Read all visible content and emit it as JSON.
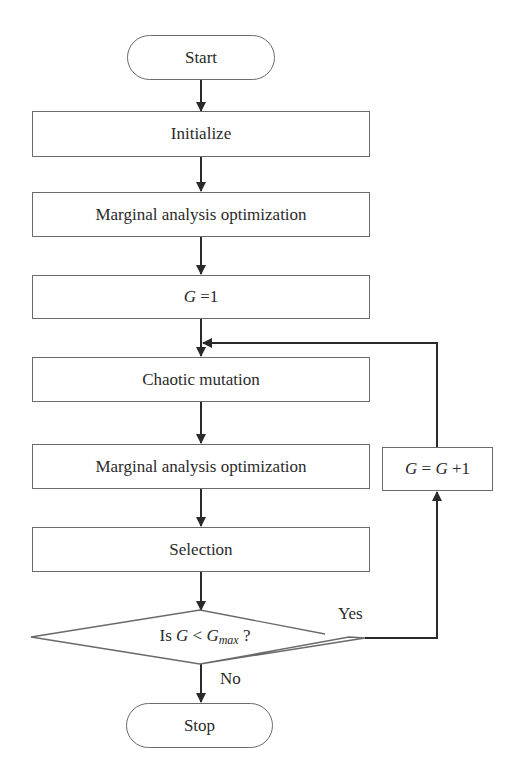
{
  "diagram": {
    "type": "flowchart",
    "nodes": {
      "start": {
        "label": "Start",
        "shape": "terminator"
      },
      "initialize": {
        "label": "Initialize",
        "shape": "process"
      },
      "marginal1": {
        "label": "Marginal analysis optimization",
        "shape": "process"
      },
      "g_init": {
        "var": "G",
        "rest": " =1",
        "shape": "process"
      },
      "chaotic": {
        "label": "Chaotic mutation",
        "shape": "process"
      },
      "marginal2": {
        "label": "Marginal analysis optimization",
        "shape": "process"
      },
      "selection": {
        "label": "Selection",
        "shape": "process"
      },
      "decision": {
        "prefix": "Is ",
        "var": "G",
        "op": " < ",
        "var2": "G",
        "sub": "max",
        "suffix": " ?",
        "shape": "decision"
      },
      "increment": {
        "var": "G",
        "eq": " = ",
        "var2": "G",
        "rest": " +1",
        "shape": "process"
      },
      "stop": {
        "label": "Stop",
        "shape": "terminator"
      }
    },
    "edge_labels": {
      "yes": "Yes",
      "no": "No"
    },
    "edges": [
      [
        "start",
        "initialize"
      ],
      [
        "initialize",
        "marginal1"
      ],
      [
        "marginal1",
        "g_init"
      ],
      [
        "g_init",
        "chaotic"
      ],
      [
        "chaotic",
        "marginal2"
      ],
      [
        "marginal2",
        "selection"
      ],
      [
        "selection",
        "decision"
      ],
      [
        "decision",
        "increment",
        "Yes"
      ],
      [
        "increment",
        "chaotic"
      ],
      [
        "decision",
        "stop",
        "No"
      ]
    ],
    "colors": {
      "stroke": "#6a6a6a",
      "arrow": "#2a2a2a",
      "text": "#2a2a2a"
    }
  }
}
